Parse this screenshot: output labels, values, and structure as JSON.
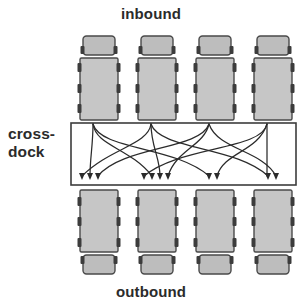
{
  "diagram": {
    "labels": {
      "inbound": "inbound",
      "outbound": "outbound",
      "crossdock_line1": "cross-",
      "crossdock_line2": "dock"
    },
    "colors": {
      "truck_body_fill": "#c6c6c6",
      "truck_cab_fill": "#bdbdbd",
      "truck_outline": "#4a4a4a",
      "wheel_fill": "#3c3c3c",
      "dock_outline": "#3c3c3c",
      "dock_fill": "#ffffff",
      "arrow_stroke": "#2b2b2b",
      "label_text": "#2b2b2b",
      "background": "#ffffff"
    },
    "dock_box": {
      "x": 71,
      "y": 123,
      "width": 225,
      "height": 62
    },
    "inbound_trucks": [
      {
        "name": "inbound-truck-1",
        "x": 80
      },
      {
        "name": "inbound-truck-2",
        "x": 138
      },
      {
        "name": "inbound-truck-3",
        "x": 196
      },
      {
        "name": "inbound-truck-4",
        "x": 254
      }
    ],
    "outbound_trucks": [
      {
        "name": "outbound-truck-1",
        "x": 80
      },
      {
        "name": "outbound-truck-2",
        "x": 138
      },
      {
        "name": "outbound-truck-3",
        "x": 196
      },
      {
        "name": "outbound-truck-4",
        "x": 254
      }
    ],
    "inbound_doors": [
      {
        "name": "inbound-door-1",
        "x": 93
      },
      {
        "name": "inbound-door-2",
        "x": 151
      },
      {
        "name": "inbound-door-3",
        "x": 209
      },
      {
        "name": "inbound-door-4",
        "x": 267
      }
    ],
    "outbound_door_groups": [
      {
        "name": "outbound-door-group-1",
        "arrows": 3,
        "x": [
          82,
          90,
          98
        ]
      },
      {
        "name": "outbound-door-group-2",
        "arrows": 3,
        "x": [
          152,
          160,
          168
        ]
      },
      {
        "name": "outbound-door-group-3",
        "arrows": 2,
        "x": [
          209,
          217
        ]
      },
      {
        "name": "outbound-door-group-4",
        "arrows": 2,
        "x": [
          268,
          276
        ]
      }
    ],
    "flows": [
      {
        "from": 1,
        "to": "1a"
      },
      {
        "from": 1,
        "to": "2a"
      },
      {
        "from": 1,
        "to": "3a"
      },
      {
        "from": 2,
        "to": "1b"
      },
      {
        "from": 2,
        "to": "2b"
      },
      {
        "from": 2,
        "to": "4a"
      },
      {
        "from": 3,
        "to": "1c"
      },
      {
        "from": 3,
        "to": "2c"
      },
      {
        "from": 3,
        "to": "4b"
      },
      {
        "from": 4,
        "to": "2d"
      },
      {
        "from": 4,
        "to": "3b"
      },
      {
        "from": 4,
        "to": "4c"
      }
    ]
  }
}
